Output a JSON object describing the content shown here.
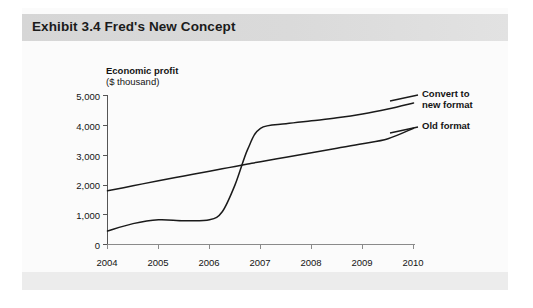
{
  "figure": {
    "title": "Exhibit 3.4 Fred's New Concept",
    "title_band_color": "#d8d8d8",
    "background_color": "#fbfbfb",
    "line_color": "#1a1a1a"
  },
  "chart_data": {
    "type": "line",
    "title": "Exhibit 3.4 Fred's New Concept",
    "xlabel": "",
    "ylabel": "Economic profit",
    "ylabel_units": "($ thousand)",
    "grid": false,
    "legend_position": "right-inline",
    "xlim": [
      2004,
      2010
    ],
    "ylim": [
      0,
      5000
    ],
    "ytick_labels": [
      "5,000",
      "4,000",
      "3,000",
      "2,000",
      "1,000",
      "0"
    ],
    "ytick_values": [
      5000,
      4000,
      3000,
      2000,
      1000,
      0
    ],
    "xtick_labels": [
      "2004",
      "2005",
      "2006",
      "2007",
      "2008",
      "2009",
      "2010"
    ],
    "xtick_values": [
      2004,
      2005,
      2006,
      2007,
      2008,
      2009,
      2010
    ],
    "x": [
      2004,
      2004.5,
      2005,
      2005.5,
      2006,
      2006.25,
      2006.5,
      2006.75,
      2007,
      2007.5,
      2008,
      2008.5,
      2009,
      2009.5,
      2010
    ],
    "series": [
      {
        "name": "Convert to new format",
        "label_lines": [
          "Convert to",
          "new format"
        ],
        "values": [
          450,
          700,
          830,
          800,
          830,
          1100,
          2000,
          3200,
          3900,
          4050,
          4150,
          4250,
          4380,
          4550,
          4750
        ]
      },
      {
        "name": "Old format",
        "label_lines": [
          "Old format"
        ],
        "values": [
          1800,
          1970,
          2140,
          2300,
          2460,
          2540,
          2620,
          2700,
          2780,
          2930,
          3080,
          3230,
          3380,
          3550,
          3900
        ]
      }
    ],
    "annotations": [
      {
        "text": "crossover of the two series occurs in late 2006 near 2,800"
      }
    ]
  }
}
